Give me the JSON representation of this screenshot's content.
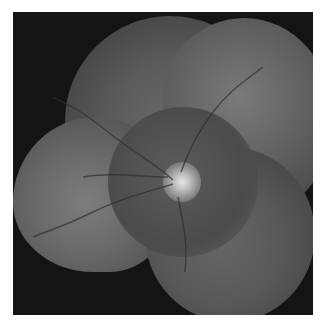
{
  "image": {
    "description": "Grayscale retinal fundus photo montage composed of overlapping circular fields on a black background",
    "colors": {
      "background": "#ffffff",
      "frame": "#141414",
      "retina_mid": "#5a5a5a",
      "optic_disc": "#e8e8e8"
    }
  }
}
